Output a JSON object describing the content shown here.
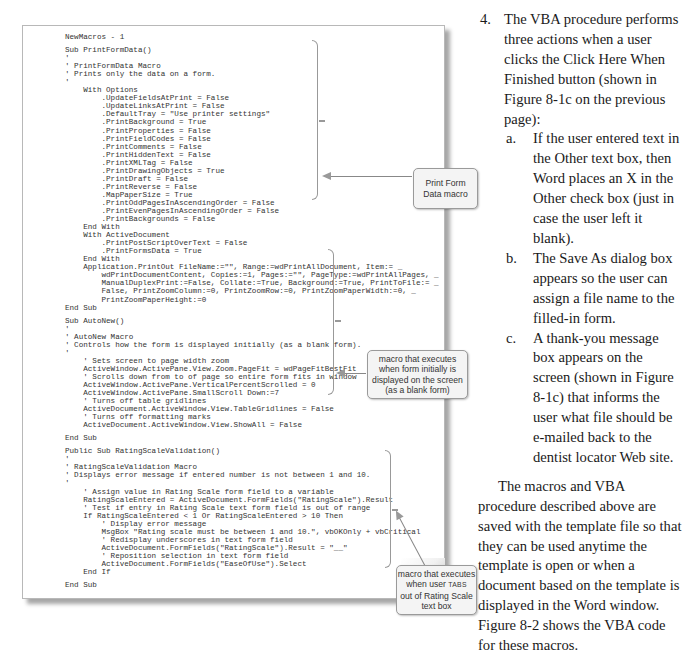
{
  "figure": {
    "code_window": {
      "lines": [
        "NewMacros - 1",
        "",
        "Sub PrintFormData()",
        "'",
        "' PrintFormData Macro",
        "' Prints only the data on a form.",
        "'",
        "    With Options",
        "        .UpdateFieldsAtPrint = False",
        "        .UpdateLinksAtPrint = False",
        "        .DefaultTray = \"Use printer settings\"",
        "        .PrintBackground = True",
        "        .PrintProperties = False",
        "        .PrintFieldCodes = False",
        "        .PrintComments = False",
        "        .PrintHiddenText = False",
        "        .PrintXMLTag = False",
        "        .PrintDrawingObjects = True",
        "        .PrintDraft = False",
        "        .PrintReverse = False",
        "        .MapPaperSize = True",
        "        .PrintOddPagesInAscendingOrder = False",
        "        .PrintEvenPagesInAscendingOrder = False",
        "        .PrintBackgrounds = False",
        "    End With",
        "    With ActiveDocument",
        "        .PrintPostScriptOverText = False",
        "        .PrintFormsData = True",
        "    End With",
        "    Application.PrintOut FileName:=\"\", Range:=wdPrintAllDocument, Item:= _",
        "        wdPrintDocumentContent, Copies:=1, Pages:=\"\", PageType:=wdPrintAllPages, _",
        "        ManualDuplexPrint:=False, Collate:=True, Background:=True, PrintToFile:= _",
        "        False, PrintZoomColumn:=0, PrintZoomRow:=0, PrintZoomPaperWidth:=0, _",
        "        PrintZoomPaperHeight:=0",
        "End Sub",
        "",
        "Sub AutoNew()",
        "'",
        "' AutoNew Macro",
        "' Controls how the form is displayed initially (as a blank form).",
        "'",
        "    ' Sets screen to page width zoom",
        "    ActiveWindow.ActivePane.View.Zoom.PageFit = wdPageFitBestFit",
        "    ' Scrolls down from to of page so entire form fits in window",
        "    ActiveWindow.ActivePane.VerticalPercentScrolled = 0",
        "    ActiveWindow.ActivePane.SmallScroll Down:=7",
        "    ' Turns off table gridlines",
        "    ActiveDocument.ActiveWindow.View.TableGridlines = False",
        "    ' Turns off formatting marks",
        "    ActiveDocument.ActiveWindow.View.ShowAll = False",
        "",
        "End Sub",
        "",
        "Public Sub RatingScaleValidation()",
        "'",
        "' RatingScaleValidation Macro",
        "' Displays error message if entered number is not between 1 and 10.",
        "'",
        "    ' Assign value in Rating Scale form field to a variable",
        "    RatingScaleEntered = ActiveDocument.FormFields(\"RatingScale\").Result",
        "    ' Test if entry in Rating Scale text form field is out of range",
        "    If RatingScaleEntered < 1 Or RatingScaleEntered > 10 Then",
        "        ' Display error message",
        "        MsgBox \"Rating scale must be between 1 and 10.\", vbOKOnly + vbCritical",
        "        ' Redisplay underscores in text form field",
        "        ActiveDocument.FormFields(\"RatingScale\").Result = \"__\"",
        "        ' Reposition selection in text form field",
        "        ActiveDocument.FormFields(\"EaseOfUse\").Select",
        "    End If",
        "",
        "End Sub"
      ]
    },
    "callouts": {
      "print_form": [
        "Print Form",
        "Data macro"
      ],
      "autonew": [
        "macro that executes",
        "when form initially is",
        "displayed on the screen",
        "(as a blank form)"
      ],
      "rating": {
        "line1": "macro that executes",
        "line2_pre": "when user ",
        "line2_key": "TABS",
        "line3": "out of Rating Scale",
        "line4": "text box"
      }
    }
  },
  "body_text": {
    "step": {
      "number": "4.",
      "text": "The VBA procedure performs three actions when a user clicks the Click Here When Finished button (shown in Figure 8-1c on the previous page):"
    },
    "substeps": [
      {
        "label": "a.",
        "text": "If the user entered text in the Other text box, then Word places an X in the Other check box (just in case the user left it blank)."
      },
      {
        "label": "b.",
        "text": "The Save As dialog box appears so the user can assign a file name to the filled-in form."
      },
      {
        "label": "c.",
        "text": "A thank-you message box appears on the screen (shown in Figure 8-1c) that informs the user what file should be e-mailed back to the dentist locator Web site."
      }
    ],
    "paragraph": "The macros and VBA procedure described above are saved with the template file so that they can be used anytime the template is open or when a document based on the template is displayed in the Word window. Figure 8-2 shows the VBA code for these macros."
  }
}
